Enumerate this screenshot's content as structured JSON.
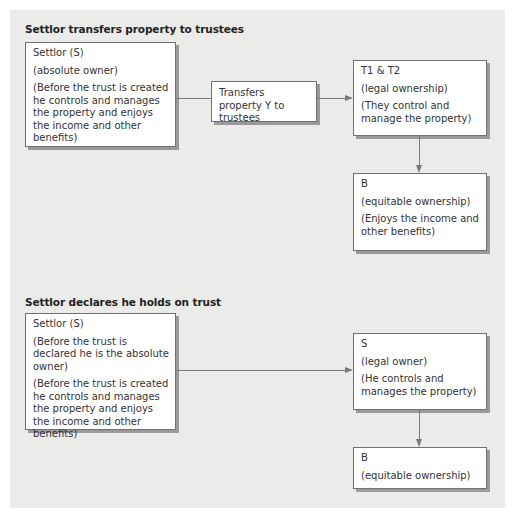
{
  "diagram": {
    "section1": {
      "title": "Settlor transfers property to trustees",
      "settlor_box": {
        "name": "Settlor (S)",
        "role": "(absolute owner)",
        "note": "(Before the trust is created he controls and manages the property and enjoys the income and other benefits)"
      },
      "transfer_box": {
        "label": "Transfers property Y to trustees"
      },
      "trustees_box": {
        "name": "T1 & T2",
        "role": "(legal ownership)",
        "note": "(They control and manage the property)"
      },
      "beneficiary_box": {
        "name": "B",
        "role": "(equitable ownership)",
        "note": "(Enjoys the income and other benefits)"
      }
    },
    "section2": {
      "title": "Settlor declares he holds on trust",
      "settlor_box": {
        "name": "Settlor (S)",
        "note1": "(Before the trust is declared he is the absolute owner)",
        "note2": "(Before the trust is created he controls and manages the property and enjoys the income and other benefits)"
      },
      "legal_owner_box": {
        "name": "S",
        "role": "(legal owner)",
        "note": "(He controls and manages the property)"
      },
      "beneficiary_box": {
        "name": "B",
        "role": "(equitable ownership)"
      }
    },
    "colors": {
      "panel_background": "#ebebea",
      "box_background": "#ffffff",
      "box_border": "#707070",
      "box_shadow": "#9a9a9a",
      "connector": "#7a7a7a"
    }
  }
}
